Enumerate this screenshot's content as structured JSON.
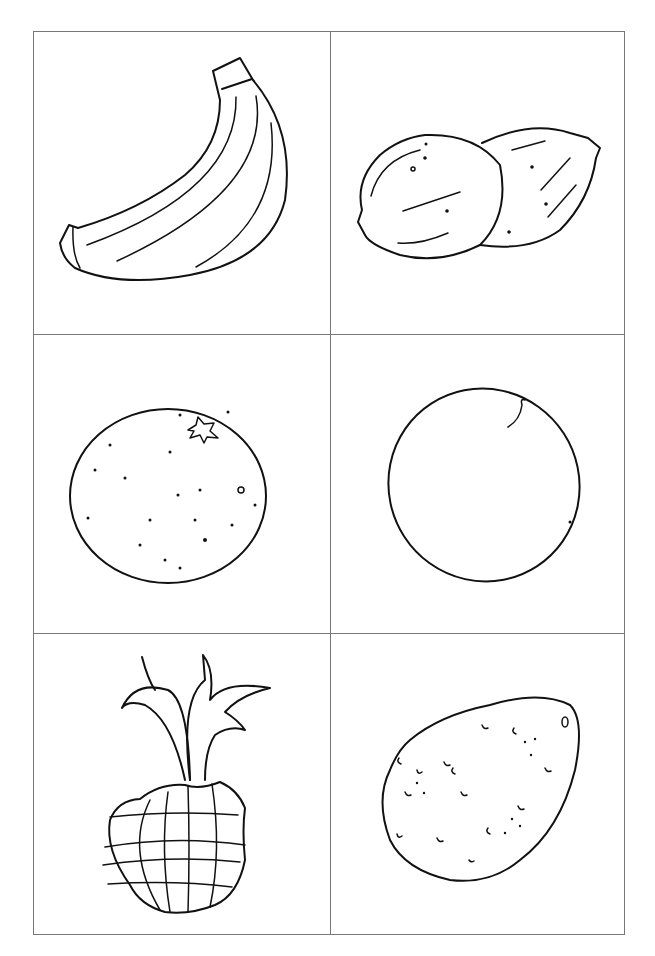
{
  "page": {
    "type": "coloring-sheet",
    "layout": "2x3 grid"
  },
  "cells": [
    {
      "id": "banana",
      "row": 1,
      "col": 1
    },
    {
      "id": "coconuts",
      "row": 1,
      "col": 2
    },
    {
      "id": "orange",
      "row": 2,
      "col": 1
    },
    {
      "id": "mango",
      "row": 2,
      "col": 2
    },
    {
      "id": "pineapple",
      "row": 3,
      "col": 1
    },
    {
      "id": "kiwi-or-sapodilla",
      "row": 3,
      "col": 2
    }
  ],
  "colors": {
    "line": "#111111",
    "border": "#777777",
    "background": "#ffffff"
  }
}
